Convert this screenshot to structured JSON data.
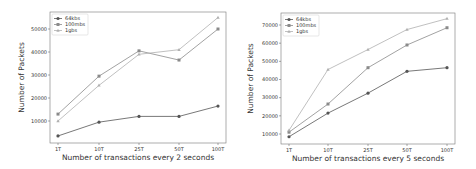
{
  "chart_data": [
    {
      "type": "line",
      "title": "",
      "categories": [
        "1T",
        "10T",
        "25T",
        "50T",
        "100T"
      ],
      "xlabel": "Number of transactions every 2 seconds",
      "ylabel": "Number of Packets",
      "yticks": [
        10000,
        20000,
        30000,
        40000,
        50000
      ],
      "ylim": [
        1000,
        58000
      ],
      "grid": false,
      "legend_position": "upper left",
      "series": [
        {
          "name": "64kbs",
          "marker": "circle",
          "color": "#555555",
          "values": [
            3500,
            9500,
            12000,
            12000,
            16500
          ]
        },
        {
          "name": "100mbs",
          "marker": "square",
          "color": "#8a8a8a",
          "values": [
            13000,
            29500,
            40500,
            36500,
            50000
          ]
        },
        {
          "name": "1gbs",
          "marker": "triangle",
          "color": "#b0b0b0",
          "values": [
            10000,
            25500,
            39000,
            41000,
            55000
          ]
        }
      ]
    },
    {
      "type": "line",
      "title": "",
      "categories": [
        "1T",
        "10T",
        "25T",
        "50T",
        "100T"
      ],
      "xlabel": "Number of transactions every 5 seconds",
      "ylabel": "Number of Packets",
      "yticks": [
        10000,
        20000,
        30000,
        40000,
        50000,
        60000,
        70000
      ],
      "ylim": [
        4500,
        76500
      ],
      "grid": false,
      "legend_position": "upper left",
      "series": [
        {
          "name": "64kbs",
          "marker": "circle",
          "color": "#555555",
          "values": [
            8500,
            21500,
            32500,
            44500,
            46500
          ]
        },
        {
          "name": "100mbs",
          "marker": "square",
          "color": "#8a8a8a",
          "values": [
            11000,
            26500,
            46500,
            59000,
            68500
          ]
        },
        {
          "name": "1gbs",
          "marker": "triangle",
          "color": "#b0b0b0",
          "values": [
            12000,
            45500,
            56500,
            67500,
            73500
          ]
        }
      ]
    }
  ],
  "layout": [
    {
      "frame": {
        "x0": 50,
        "y0": 12,
        "x1": 226,
        "y1": 143
      },
      "xticks_px": [
        58,
        99,
        139,
        179,
        218
      ],
      "ymap": {
        "v0": 10000,
        "p0": 121,
        "v1": 50000,
        "p1": 29
      }
    },
    {
      "frame": {
        "x0": 281,
        "y0": 13,
        "x1": 455,
        "y1": 144
      },
      "xticks_px": [
        289,
        328,
        368,
        407,
        447
      ],
      "ymap": {
        "v0": 10000,
        "p0": 134,
        "v1": 70000,
        "p1": 25
      }
    }
  ]
}
